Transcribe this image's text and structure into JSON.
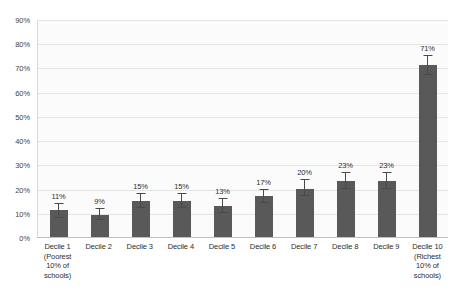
{
  "chart_data": {
    "type": "bar",
    "title": "",
    "subtitle": "",
    "xlabel": "",
    "ylabel": "",
    "ylim": [
      0,
      90
    ],
    "ytick_step": 10,
    "grid": true,
    "legend": null,
    "bar_color": "#595959",
    "plot_background": "#fbfbfb",
    "gridline_color": "#e4e4e4",
    "error_bar_color": "#4a4a4a",
    "categories": [
      "Decile 1 (Poorest 10% of schools)",
      "Decile 2",
      "Decile 3",
      "Decile 4",
      "Decile 5",
      "Decile 6",
      "Decile 7",
      "Decile 8",
      "Decile 9",
      "Decile 10 (Richest 10% of schools)"
    ],
    "category_lines": [
      [
        "Decile 1",
        "(Poorest",
        "10% of",
        "schools)"
      ],
      [
        "Decile 2"
      ],
      [
        "Decile 3"
      ],
      [
        "Decile 4"
      ],
      [
        "Decile 5"
      ],
      [
        "Decile 6"
      ],
      [
        "Decile 7"
      ],
      [
        "Decile 8"
      ],
      [
        "Decile 9"
      ],
      [
        "Decile 10",
        "(Richest",
        "10% of",
        "schools)"
      ]
    ],
    "values": [
      11,
      9,
      15,
      15,
      13,
      17,
      20,
      23,
      23,
      71
    ],
    "data_labels": [
      "11%",
      "9%",
      "15%",
      "15%",
      "13%",
      "17%",
      "20%",
      "23%",
      "23%",
      "71%"
    ],
    "error_bars": [
      {
        "low": 8,
        "high": 14
      },
      {
        "low": 7,
        "high": 12
      },
      {
        "low": 12,
        "high": 18
      },
      {
        "low": 12,
        "high": 18
      },
      {
        "low": 10,
        "high": 16
      },
      {
        "low": 14,
        "high": 20
      },
      {
        "low": 17,
        "high": 24
      },
      {
        "low": 20,
        "high": 27
      },
      {
        "low": 20,
        "high": 27
      },
      {
        "low": 67,
        "high": 75
      }
    ],
    "ytick_labels": [
      "90%",
      "80%",
      "70%",
      "60%",
      "50%",
      "40%",
      "30%",
      "20%",
      "10%",
      "0%"
    ],
    "ytick_values": [
      90,
      80,
      70,
      60,
      50,
      40,
      30,
      20,
      10,
      0
    ]
  }
}
